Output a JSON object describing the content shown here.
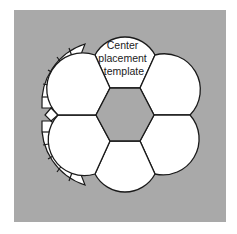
{
  "figure": {
    "label_lines": [
      "Center",
      "placement",
      "template"
    ],
    "colors": {
      "background": "#ffffff",
      "panel": "#a9a9a9",
      "center_hexagon": "#a9a9a9",
      "petal_fill": "#ffffff",
      "stroke": "#1a1a1a"
    },
    "petals": [
      {
        "position": "top",
        "labeled": true
      },
      {
        "position": "upper-right",
        "labeled": false
      },
      {
        "position": "lower-right",
        "labeled": false
      },
      {
        "position": "bottom",
        "labeled": false
      },
      {
        "position": "lower-left",
        "labeled": false
      },
      {
        "position": "upper-left",
        "labeled": false
      }
    ],
    "segmented_strips": [
      {
        "position": "upper-left",
        "segments": 6
      },
      {
        "position": "lower-left",
        "segments": 6
      }
    ]
  }
}
